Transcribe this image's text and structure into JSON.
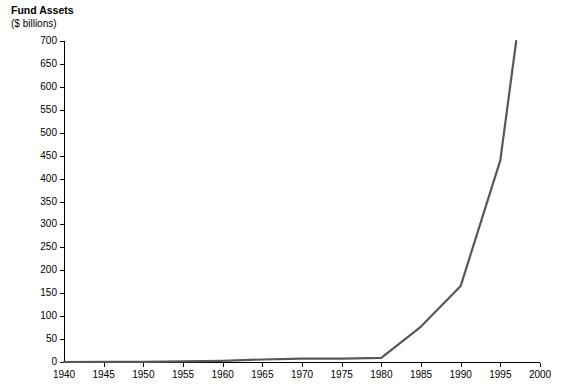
{
  "chart_data": {
    "type": "line",
    "title": "",
    "ylabel_line1": "Fund Assets",
    "ylabel_line2": "($ billions)",
    "xlabel": "",
    "xlim": [
      1940,
      2000
    ],
    "ylim": [
      0,
      700
    ],
    "grid": false,
    "legend": null,
    "ytick_labels": [
      "0",
      "50",
      "100",
      "150",
      "200",
      "250",
      "300",
      "350",
      "400",
      "450",
      "500",
      "550",
      "600",
      "650",
      "700"
    ],
    "ytick_values": [
      0,
      50,
      100,
      150,
      200,
      250,
      300,
      350,
      400,
      450,
      500,
      550,
      600,
      650,
      700
    ],
    "xtick_labels": [
      "1940",
      "1945",
      "1950",
      "1955",
      "1960",
      "1965",
      "1970",
      "1975",
      "1980",
      "1985",
      "1990",
      "1995",
      "2000"
    ],
    "xtick_values": [
      1940,
      1945,
      1950,
      1955,
      1960,
      1965,
      1970,
      1975,
      1980,
      1985,
      1990,
      1995,
      2000
    ],
    "series": [
      {
        "name": "Fund Assets",
        "color": "#58585a",
        "x": [
          1940,
          1945,
          1950,
          1955,
          1960,
          1965,
          1970,
          1975,
          1980,
          1985,
          1990,
          1995,
          1997
        ],
        "values": [
          0.5,
          1,
          3,
          8,
          17,
          35,
          48,
          46,
          58,
          495,
          1065,
          2820,
          4490
        ]
      }
    ],
    "series_plot_values": [
      0.5,
      1,
      3,
      8,
      17,
      35,
      48,
      46,
      58,
      495,
      1065,
      2820,
      4490
    ]
  }
}
